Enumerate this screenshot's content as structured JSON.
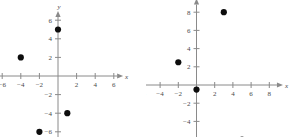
{
  "figure": {
    "background_color": "#ffffff",
    "axis_color": "#8a8a8a",
    "point_color": "#0d0d0d",
    "label_color": "#4a4a4a"
  },
  "chart_data": [
    {
      "type": "scatter",
      "title": "",
      "xlabel": "x",
      "ylabel": "y",
      "xlim": [
        -7,
        7
      ],
      "ylim": [
        -7,
        7
      ],
      "grid": false,
      "legend": null,
      "xticks": [
        -6,
        -4,
        -2,
        2,
        4,
        6
      ],
      "yticks": [
        -6,
        -4,
        -2,
        2,
        4,
        6
      ],
      "xticklabels": [
        "-6",
        "-4",
        "-2",
        "2",
        "4",
        "6"
      ],
      "yticklabels": [
        "-6",
        "-4",
        "-2",
        "2",
        "4",
        "6"
      ],
      "points": [
        {
          "x": 0,
          "y": 5
        },
        {
          "x": -4,
          "y": 2
        },
        {
          "x": 1,
          "y": -4
        },
        {
          "x": -2,
          "y": -6
        }
      ]
    },
    {
      "type": "scatter",
      "title": "",
      "xlabel": "x",
      "ylabel": "y",
      "xlim": [
        -7,
        9.5
      ],
      "ylim": [
        -7,
        9.5
      ],
      "grid": false,
      "legend": null,
      "xticks": [
        -6,
        -4,
        -2,
        2,
        4,
        6,
        8
      ],
      "yticks": [
        -6,
        -4,
        -2,
        2,
        4,
        6,
        8
      ],
      "xticklabels": [
        "-6",
        "-4",
        "-2",
        "2",
        "4",
        "6",
        "8"
      ],
      "yticklabels": [
        "-6",
        "-4",
        "-2",
        "2",
        "4",
        "6",
        "8"
      ],
      "points": [
        {
          "x": 3,
          "y": 8
        },
        {
          "x": -2,
          "y": 2.5
        },
        {
          "x": 0,
          "y": -0.5
        },
        {
          "x": 5,
          "y": -6
        }
      ]
    }
  ]
}
